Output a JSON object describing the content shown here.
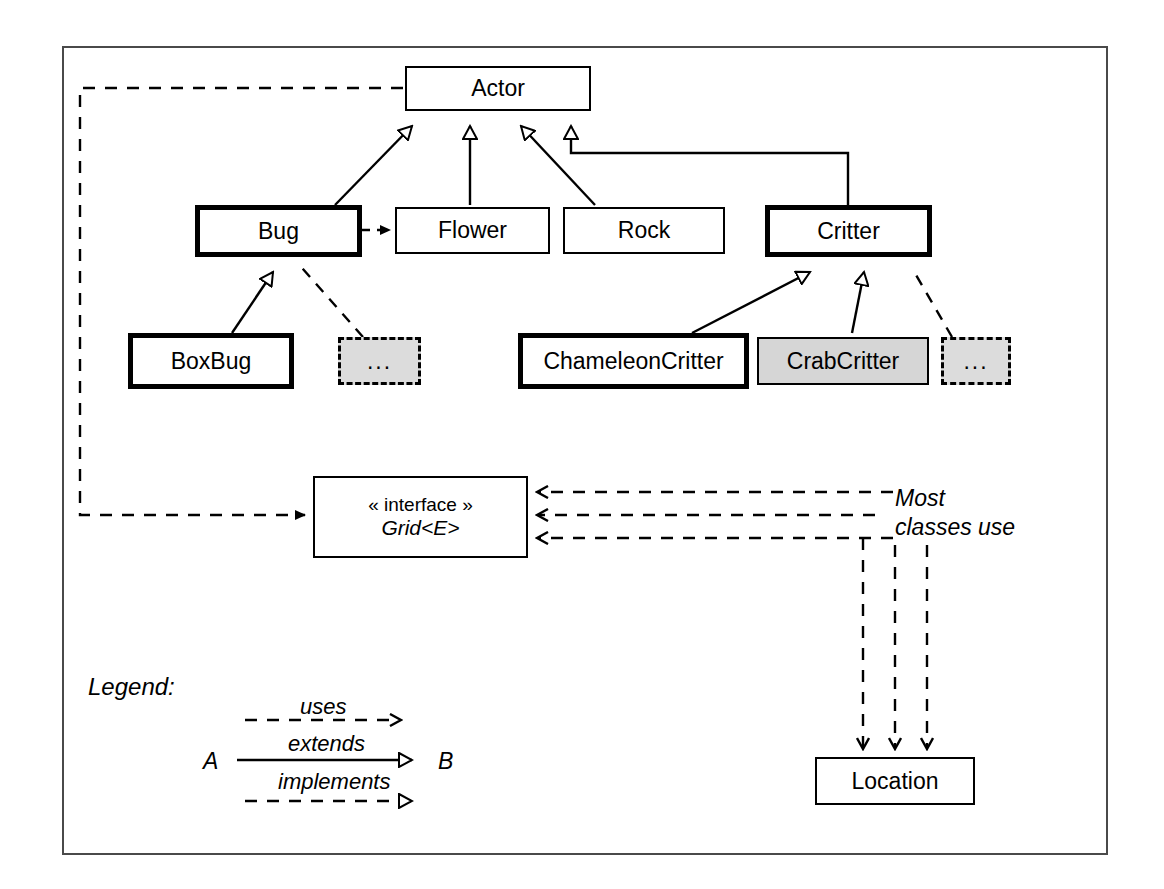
{
  "diagram": {
    "frame": {
      "border_color": "#4a4a4a"
    },
    "colors": {
      "line": "#000000",
      "ghost_fill": "#dcdcdc",
      "shaded_fill": "#d6d6d6",
      "box_fill": "#ffffff"
    },
    "nodes": [
      {
        "id": "actor",
        "label": "Actor",
        "style": "thin"
      },
      {
        "id": "bug",
        "label": "Bug",
        "style": "thick"
      },
      {
        "id": "flower",
        "label": "Flower",
        "style": "thin"
      },
      {
        "id": "rock",
        "label": "Rock",
        "style": "thin"
      },
      {
        "id": "critter",
        "label": "Critter",
        "style": "thick"
      },
      {
        "id": "boxbug",
        "label": "BoxBug",
        "style": "thick"
      },
      {
        "id": "bug-more",
        "label": "...",
        "style": "ghost"
      },
      {
        "id": "chameleoncritter",
        "label": "ChameleonCritter",
        "style": "thick"
      },
      {
        "id": "crabcritter",
        "label": "CrabCritter",
        "style": "shaded"
      },
      {
        "id": "critter-more",
        "label": "...",
        "style": "ghost"
      },
      {
        "id": "location",
        "label": "Location",
        "style": "thin"
      }
    ],
    "interface_node": {
      "id": "grid",
      "stereotype": "« interface »",
      "name": "Grid<E>",
      "style": "thin"
    },
    "note": "Most\nclasses use",
    "legend": {
      "title": "Legend:",
      "source": "A",
      "target": "B",
      "rows": [
        {
          "id": "uses",
          "label": "uses",
          "line": "dashed",
          "head": "open-arrow"
        },
        {
          "id": "extends",
          "label": "extends",
          "line": "solid",
          "head": "hollow-triangle"
        },
        {
          "id": "implements",
          "label": "implements",
          "line": "dashed",
          "head": "hollow-triangle"
        }
      ]
    },
    "relationships": [
      {
        "from": "bug",
        "to": "actor",
        "kind": "extends"
      },
      {
        "from": "flower",
        "to": "actor",
        "kind": "extends"
      },
      {
        "from": "rock",
        "to": "actor",
        "kind": "extends"
      },
      {
        "from": "critter",
        "to": "actor",
        "kind": "extends"
      },
      {
        "from": "boxbug",
        "to": "bug",
        "kind": "extends"
      },
      {
        "from": "bug-more",
        "to": "bug",
        "kind": "extends"
      },
      {
        "from": "chameleoncritter",
        "to": "critter",
        "kind": "extends"
      },
      {
        "from": "crabcritter",
        "to": "critter",
        "kind": "extends"
      },
      {
        "from": "critter-more",
        "to": "critter",
        "kind": "extends"
      },
      {
        "from": "bug",
        "to": "flower",
        "kind": "uses"
      },
      {
        "from": "actor",
        "to": "grid",
        "kind": "uses"
      },
      {
        "from": "note",
        "to": "grid",
        "kind": "uses",
        "count": 3
      },
      {
        "from": "note",
        "to": "location",
        "kind": "uses",
        "count": 3
      }
    ]
  }
}
